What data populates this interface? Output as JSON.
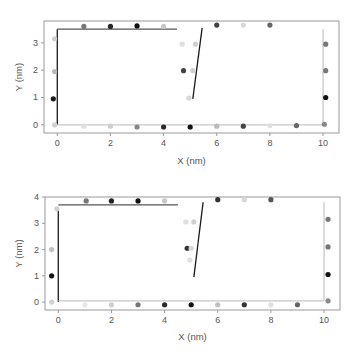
{
  "chart_data": [
    {
      "type": "scatter",
      "panel": "top",
      "xlabel": "X (nm)",
      "ylabel": "Y (nm)",
      "xlim": [
        -0.5,
        10.6
      ],
      "ylim": [
        -0.3,
        3.8
      ],
      "xticks": [
        0,
        2,
        4,
        6,
        8,
        10
      ],
      "yticks": [
        0,
        1,
        2,
        3
      ],
      "grid": false,
      "lines": [
        {
          "name": "left-wall",
          "color": "#1a1a1a",
          "points": [
            [
              0.0,
              0.0
            ],
            [
              0.0,
              3.5
            ]
          ]
        },
        {
          "name": "top-wall",
          "color": "#555555",
          "points": [
            [
              0.0,
              3.5
            ],
            [
              4.5,
              3.5
            ]
          ]
        },
        {
          "name": "middle-wall",
          "color": "#1a1a1a",
          "points": [
            [
              5.45,
              3.55
            ],
            [
              5.1,
              0.95
            ]
          ]
        },
        {
          "name": "right-wall",
          "color": "#c8c8c8",
          "points": [
            [
              10.0,
              3.5
            ],
            [
              10.0,
              0.0
            ]
          ]
        },
        {
          "name": "bottom-wall",
          "color": "#c8c8c8",
          "points": [
            [
              0.0,
              0.0
            ],
            [
              10.0,
              0.0
            ]
          ]
        }
      ],
      "points": [
        {
          "x": -0.1,
          "y": 3.15,
          "color": "#d0d0d0"
        },
        {
          "x": -0.1,
          "y": 1.95,
          "color": "#b8b8b8"
        },
        {
          "x": -0.15,
          "y": 0.95,
          "color": "#1a1a1a"
        },
        {
          "x": -0.1,
          "y": 0.0,
          "color": "#d0d0d0"
        },
        {
          "x": 1.0,
          "y": 3.6,
          "color": "#777777"
        },
        {
          "x": 2.0,
          "y": 3.6,
          "color": "#2a2a2a"
        },
        {
          "x": 3.0,
          "y": 3.62,
          "color": "#111111"
        },
        {
          "x": 4.0,
          "y": 3.6,
          "color": "#c8c8c8"
        },
        {
          "x": 6.0,
          "y": 3.65,
          "color": "#444444"
        },
        {
          "x": 7.0,
          "y": 3.65,
          "color": "#d8d8d8"
        },
        {
          "x": 8.0,
          "y": 3.65,
          "color": "#666666"
        },
        {
          "x": 4.7,
          "y": 2.95,
          "color": "#e0e0e0"
        },
        {
          "x": 5.2,
          "y": 2.95,
          "color": "#d0d0d0"
        },
        {
          "x": 4.75,
          "y": 1.98,
          "color": "#444444"
        },
        {
          "x": 5.1,
          "y": 1.98,
          "color": "#d0d0d0"
        },
        {
          "x": 4.95,
          "y": 0.98,
          "color": "#d8d8d8"
        },
        {
          "x": 10.1,
          "y": 2.95,
          "color": "#777777"
        },
        {
          "x": 10.1,
          "y": 1.98,
          "color": "#777777"
        },
        {
          "x": 10.1,
          "y": 1.0,
          "color": "#111111"
        },
        {
          "x": 10.05,
          "y": 0.02,
          "color": "#888888"
        },
        {
          "x": 1.0,
          "y": -0.05,
          "color": "#e0e0e0"
        },
        {
          "x": 2.0,
          "y": -0.05,
          "color": "#d0d0d0"
        },
        {
          "x": 3.0,
          "y": -0.08,
          "color": "#888888"
        },
        {
          "x": 4.0,
          "y": -0.08,
          "color": "#2a2a2a"
        },
        {
          "x": 5.0,
          "y": -0.08,
          "color": "#111111"
        },
        {
          "x": 6.0,
          "y": -0.05,
          "color": "#bbbbbb"
        },
        {
          "x": 7.0,
          "y": -0.05,
          "color": "#444444"
        },
        {
          "x": 8.0,
          "y": -0.03,
          "color": "#e0e0e0"
        },
        {
          "x": 9.0,
          "y": -0.03,
          "color": "#666666"
        }
      ]
    },
    {
      "type": "scatter",
      "panel": "bottom",
      "xlabel": "X (nm)",
      "ylabel": "Y (nm)",
      "xlim": [
        -0.5,
        10.6
      ],
      "ylim": [
        -0.3,
        4.0
      ],
      "xticks": [
        0,
        2,
        4,
        6,
        8,
        10
      ],
      "yticks": [
        0,
        1,
        2,
        3,
        4
      ],
      "grid": false,
      "lines": [
        {
          "name": "left-wall",
          "color": "#1a1a1a",
          "points": [
            [
              0.0,
              0.0
            ],
            [
              0.0,
              3.6
            ]
          ]
        },
        {
          "name": "top-wall",
          "color": "#555555",
          "points": [
            [
              0.0,
              3.7
            ],
            [
              4.5,
              3.7
            ]
          ]
        },
        {
          "name": "middle-wall",
          "color": "#1a1a1a",
          "points": [
            [
              5.45,
              3.8
            ],
            [
              5.1,
              0.95
            ]
          ]
        },
        {
          "name": "right-wall",
          "color": "#c8c8c8",
          "points": [
            [
              10.0,
              3.8
            ],
            [
              10.0,
              0.05
            ]
          ]
        },
        {
          "name": "bottom-wall",
          "color": "#c8c8c8",
          "points": [
            [
              0.0,
              0.05
            ],
            [
              10.0,
              0.05
            ]
          ]
        }
      ],
      "points": [
        {
          "x": -0.05,
          "y": 3.55,
          "color": "#d0d0d0"
        },
        {
          "x": -0.25,
          "y": 2.0,
          "color": "#c0c0c0"
        },
        {
          "x": -0.25,
          "y": 1.0,
          "color": "#111111"
        },
        {
          "x": -0.25,
          "y": 0.0,
          "color": "#d0d0d0"
        },
        {
          "x": 1.05,
          "y": 3.85,
          "color": "#777777"
        },
        {
          "x": 2.0,
          "y": 3.85,
          "color": "#222222"
        },
        {
          "x": 3.0,
          "y": 3.85,
          "color": "#111111"
        },
        {
          "x": 4.0,
          "y": 3.85,
          "color": "#c8c8c8"
        },
        {
          "x": 6.0,
          "y": 3.9,
          "color": "#333333"
        },
        {
          "x": 7.0,
          "y": 3.9,
          "color": "#d8d8d8"
        },
        {
          "x": 8.0,
          "y": 3.9,
          "color": "#555555"
        },
        {
          "x": 4.8,
          "y": 3.05,
          "color": "#e0e0e0"
        },
        {
          "x": 5.1,
          "y": 3.05,
          "color": "#d0d0d0"
        },
        {
          "x": 4.85,
          "y": 2.05,
          "color": "#333333"
        },
        {
          "x": 5.0,
          "y": 2.05,
          "color": "#d8d8d8"
        },
        {
          "x": 4.95,
          "y": 1.6,
          "color": "#e0e0e0"
        },
        {
          "x": 10.15,
          "y": 3.15,
          "color": "#777777"
        },
        {
          "x": 10.15,
          "y": 2.1,
          "color": "#777777"
        },
        {
          "x": 10.15,
          "y": 1.05,
          "color": "#111111"
        },
        {
          "x": 10.15,
          "y": 0.05,
          "color": "#888888"
        },
        {
          "x": 1.0,
          "y": -0.1,
          "color": "#e8e8e8"
        },
        {
          "x": 2.0,
          "y": -0.1,
          "color": "#d0d0d0"
        },
        {
          "x": 3.0,
          "y": -0.1,
          "color": "#777777"
        },
        {
          "x": 4.0,
          "y": -0.1,
          "color": "#2a2a2a"
        },
        {
          "x": 5.0,
          "y": -0.1,
          "color": "#111111"
        },
        {
          "x": 6.0,
          "y": -0.1,
          "color": "#c0c0c0"
        },
        {
          "x": 7.0,
          "y": -0.1,
          "color": "#333333"
        },
        {
          "x": 8.0,
          "y": -0.1,
          "color": "#e0e0e0"
        },
        {
          "x": 9.0,
          "y": -0.1,
          "color": "#666666"
        }
      ]
    }
  ]
}
